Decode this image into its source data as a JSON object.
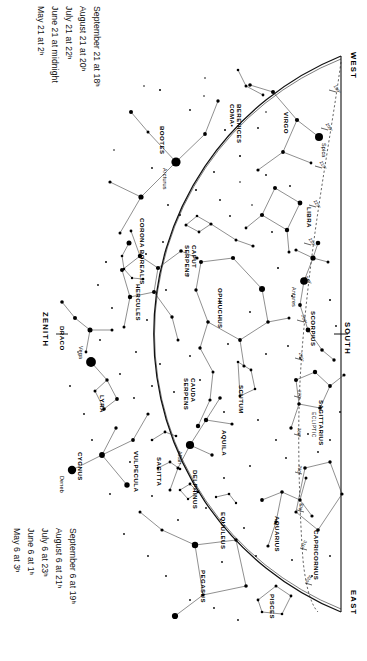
{
  "chart_data": {
    "type": "scatter",
    "projection": "half-dome horizon map, rotated 90 degrees",
    "xlabel": "",
    "ylabel": "",
    "grid": false,
    "legend_position": "none",
    "horizon_directions": {
      "west": "WEST",
      "east": "EAST",
      "south": "SOUTH",
      "zenith": "ZENITH"
    },
    "ecliptic_label": "ECLIPTIC",
    "ecliptic_degrees": [
      "190°",
      "200°",
      "210°",
      "220°",
      "230°",
      "240°",
      "250°",
      "260°",
      "270°",
      "280°",
      "290°",
      "300°",
      "310°",
      "320°",
      "330°",
      "340°"
    ],
    "named_stars": [
      {
        "name": "Arcturus",
        "x": 176,
        "y": 162,
        "mag_px": 7.0
      },
      {
        "name": "Spica",
        "x": 319,
        "y": 137,
        "mag_px": 6.0
      },
      {
        "name": "Antares",
        "x": 304,
        "y": 281,
        "mag_px": 5.6
      },
      {
        "name": "Vega",
        "x": 91,
        "y": 362,
        "mag_px": 7.4
      },
      {
        "name": "Deneb",
        "x": 72,
        "y": 470,
        "mag_px": 6.4
      },
      {
        "name": "Altair",
        "x": 190,
        "y": 445,
        "mag_px": 6.2
      }
    ],
    "constellations": [
      {
        "name": "COMA BERENICES",
        "lines": [
          "COMA•",
          "BERENICES"
        ],
        "x": 236,
        "y": 104
      },
      {
        "name": "VIRGO",
        "lines": [
          "VIRGO"
        ],
        "x": 290,
        "y": 112
      },
      {
        "name": "BOOTES",
        "lines": [
          "BOOTES"
        ],
        "x": 166,
        "y": 126
      },
      {
        "name": "CORONA BOREALIS",
        "lines": [
          "CORONA BOREALIS"
        ],
        "x": 146,
        "y": 218
      },
      {
        "name": "LIBRA",
        "lines": [
          "LIBRA"
        ],
        "x": 313,
        "y": 207
      },
      {
        "name": "SERPENS CAPUT",
        "lines": [
          "SERPENS",
          "CAPUT"
        ],
        "x": 191,
        "y": 245
      },
      {
        "name": "HERCULES",
        "lines": [
          "HERCULES"
        ],
        "x": 142,
        "y": 284
      },
      {
        "name": "OPHIUCHUS",
        "lines": [
          "OPHIUCHUS"
        ],
        "x": 224,
        "y": 288
      },
      {
        "name": "SCORPIUS",
        "lines": [
          "SCORPIUS"
        ],
        "x": 317,
        "y": 311
      },
      {
        "name": "DRACO",
        "lines": [
          "DRACO"
        ],
        "x": 66,
        "y": 326
      },
      {
        "name": "SERPENS CAUDA",
        "lines": [
          "SERPENS",
          "CAUDA"
        ],
        "x": 190,
        "y": 378
      },
      {
        "name": "SCUTUM",
        "lines": [
          "SCUTUM"
        ],
        "x": 245,
        "y": 385
      },
      {
        "name": "LYRA",
        "lines": [
          "LYRA"
        ],
        "x": 106,
        "y": 395
      },
      {
        "name": "SAGITTARIUS",
        "lines": [
          "SAGITTARIUS"
        ],
        "x": 325,
        "y": 400
      },
      {
        "name": "AQUILA",
        "lines": [
          "AQUILA"
        ],
        "x": 228,
        "y": 430
      },
      {
        "name": "CYGNUS",
        "lines": [
          "CYGNUS"
        ],
        "x": 84,
        "y": 452
      },
      {
        "name": "VULPECULA",
        "lines": [
          "VULPECULA"
        ],
        "x": 140,
        "y": 451
      },
      {
        "name": "SAGITTA",
        "lines": [
          "SAGITTA"
        ],
        "x": 163,
        "y": 457
      },
      {
        "name": "DELPHINUS",
        "lines": [
          "DELPHINUS"
        ],
        "x": 199,
        "y": 470
      },
      {
        "name": "EQUULEUS",
        "lines": [
          "EQUULEUS"
        ],
        "x": 227,
        "y": 512
      },
      {
        "name": "CAPRICORNUS",
        "lines": [
          "CAPRICORNUS"
        ],
        "x": 320,
        "y": 530
      },
      {
        "name": "AQUARIUS",
        "lines": [
          "AQUARIUS"
        ],
        "x": 281,
        "y": 516
      },
      {
        "name": "PEGASUS",
        "lines": [
          "PEGASUS"
        ],
        "x": 207,
        "y": 570
      },
      {
        "name": "PISCES",
        "lines": [
          "PISCES"
        ],
        "x": 276,
        "y": 594
      }
    ]
  },
  "date_columns": {
    "upper": {
      "caption": "evening dates column upper",
      "rows": [
        "May 21 at        2ʰ",
        "June 21 at midnight",
        "July 21 at        22ʰ",
        "August 21 at     20ʰ",
        "September 21 at 18ʰ"
      ]
    },
    "lower": {
      "caption": "evening dates column lower",
      "rows": [
        "May 6 at         3ʰ",
        "June 6 at        1ʰ",
        "July 6 at       23ʰ",
        "August 6 at     21ʰ",
        "September 6 at  19ʰ"
      ]
    }
  },
  "labels": {
    "west": "WEST",
    "east": "EAST",
    "south": "SOUTH",
    "zenith": "ZENITH",
    "ecliptic": "ECLIPTIC"
  }
}
